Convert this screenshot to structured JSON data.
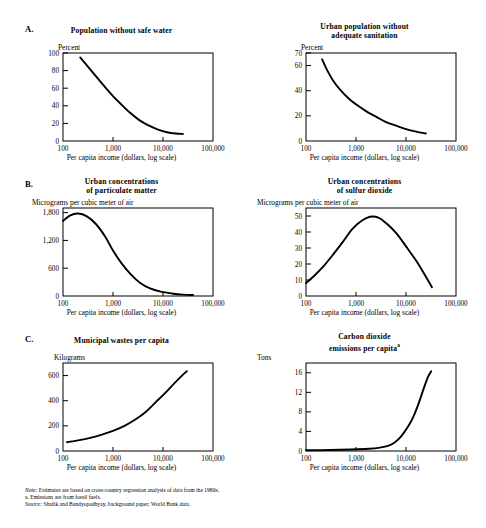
{
  "figure": {
    "panels": [
      {
        "letter": "A.",
        "left": {
          "title_line1": "Population without safe water",
          "title_line2": "",
          "y_unit": "Percent",
          "x_caption": "Per capita income (dollars, log scale)"
        },
        "right": {
          "title_line1": "Urban population without",
          "title_line2": "adequate sanitation",
          "y_unit": "Percent",
          "x_caption": "Per capita income (dollars, log scale)"
        }
      },
      {
        "letter": "B.",
        "left": {
          "title_line1": "Urban concentrations",
          "title_line2": "of particulate matter",
          "y_unit": "Micrograms per cubic meter of air",
          "x_caption": "Per capita income (dollars, log scale)"
        },
        "right": {
          "title_line1": "Urban concentrations",
          "title_line2": "of sulfur dioxide",
          "y_unit": "Micrograms per cubic meter of air",
          "x_caption": "Per capita income (dollars, log scale)"
        }
      },
      {
        "letter": "C.",
        "left": {
          "title_line1": "Municipal wastes per capita",
          "title_line2": "",
          "y_unit": "Kilograms",
          "x_caption": "Per capita income (dollars, log scale)"
        },
        "right": {
          "title_line1": "Carbon dioxide",
          "title_line2": "emissions per capita",
          "title_superscript": "a",
          "y_unit": "Tons",
          "x_caption": "Per capita income (dollars, log scale)"
        }
      }
    ],
    "notes": {
      "note_label": "Note:",
      "note_text": " Estimates are based on cross-country regression analysis of data from the 1980s.",
      "footnote_a": "a. Emissions are from fossil fuels.",
      "source_label": "Source:",
      "source_text": " Shafik and Bandyopadhyay, background paper; World Bank data."
    }
  },
  "chart_data": [
    {
      "id": "population-without-safe-water",
      "type": "line",
      "title": "Population without safe water",
      "xlabel": "Per capita income (dollars, log scale)",
      "ylabel": "Percent",
      "xscale": "log",
      "xlim": [
        100,
        100000
      ],
      "ylim": [
        0,
        100
      ],
      "xticks": [
        100,
        1000,
        10000,
        100000
      ],
      "xticklabels": [
        "100",
        "1,000",
        "10,000",
        "100,000"
      ],
      "yticks": [
        0,
        20,
        40,
        60,
        80,
        100
      ],
      "yticklabels": [
        "0",
        "20",
        "40",
        "60",
        "80",
        "100"
      ],
      "grid": false,
      "legend": "none",
      "x": [
        220,
        300,
        450,
        700,
        1000,
        1500,
        2200,
        3300,
        5000,
        8000,
        12000,
        18000,
        25000
      ],
      "y": [
        95,
        86,
        74,
        61,
        51,
        41,
        32,
        24,
        18,
        13,
        10,
        8.5,
        8
      ]
    },
    {
      "id": "urban-population-without-adequate-sanitation",
      "type": "line",
      "title": "Urban population without adequate sanitation",
      "xlabel": "Per capita income (dollars, log scale)",
      "ylabel": "Percent",
      "xscale": "log",
      "xlim": [
        100,
        100000
      ],
      "ylim": [
        0,
        70
      ],
      "xticks": [
        100,
        1000,
        10000,
        100000
      ],
      "xticklabels": [
        "100",
        "1,000",
        "10,000",
        "100,000"
      ],
      "yticks": [
        0,
        20,
        40,
        60,
        70
      ],
      "yticklabels": [
        "0",
        "20",
        "40",
        "60",
        "70"
      ],
      "grid": false,
      "legend": "none",
      "x": [
        210,
        260,
        350,
        500,
        750,
        1100,
        1700,
        2600,
        4000,
        6500,
        10000,
        16000,
        25000
      ],
      "y": [
        65,
        57,
        48,
        40,
        33,
        28,
        23,
        19,
        15,
        12,
        9.5,
        7.5,
        6
      ]
    },
    {
      "id": "urban-concentrations-of-particulate-matter",
      "type": "line",
      "title": "Urban concentrations of particulate matter",
      "xlabel": "Per capita income (dollars, log scale)",
      "ylabel": "Micrograms per cubic meter of air",
      "xscale": "log",
      "xlim": [
        100,
        100000
      ],
      "ylim": [
        0,
        1900
      ],
      "xticks": [
        100,
        1000,
        10000,
        100000
      ],
      "xticklabels": [
        "100",
        "1,000",
        "10,000",
        "100,000"
      ],
      "yticks": [
        0,
        600,
        1200,
        1800
      ],
      "yticklabels": [
        "0",
        "600",
        "1,200",
        "1,800"
      ],
      "grid": false,
      "legend": "none",
      "x": [
        100,
        140,
        200,
        300,
        450,
        700,
        1000,
        1500,
        2300,
        3500,
        5500,
        9000,
        15000,
        25000,
        40000
      ],
      "y": [
        1620,
        1740,
        1780,
        1720,
        1560,
        1280,
        980,
        700,
        460,
        280,
        165,
        95,
        55,
        30,
        20
      ]
    },
    {
      "id": "urban-concentrations-of-sulfur-dioxide",
      "type": "line",
      "title": "Urban concentrations of sulfur dioxide",
      "xlabel": "Per capita income (dollars, log scale)",
      "ylabel": "Micrograms per cubic meter of air",
      "xscale": "log",
      "xlim": [
        100,
        100000
      ],
      "ylim": [
        0,
        55
      ],
      "xticks": [
        100,
        1000,
        10000,
        100000
      ],
      "xticklabels": [
        "100",
        "1,000",
        "10,000",
        "100,000"
      ],
      "yticks": [
        0,
        10,
        20,
        30,
        40,
        50
      ],
      "yticklabels": [
        "0",
        "10",
        "20",
        "30",
        "40",
        "50"
      ],
      "grid": false,
      "legend": "none",
      "x": [
        100,
        150,
        230,
        350,
        550,
        850,
        1300,
        1900,
        2800,
        4200,
        6500,
        10000,
        16000,
        24000,
        33000
      ],
      "y": [
        8,
        13,
        19,
        26,
        34,
        42,
        47,
        49.5,
        49,
        45,
        39,
        31,
        22,
        13,
        5.5
      ]
    },
    {
      "id": "municipal-wastes-per-capita",
      "type": "line",
      "title": "Municipal wastes per capita",
      "xlabel": "Per capita income (dollars, log scale)",
      "ylabel": "Kilograms",
      "xscale": "log",
      "xlim": [
        100,
        100000
      ],
      "ylim": [
        0,
        700
      ],
      "xticks": [
        100,
        1000,
        10000,
        100000
      ],
      "xticklabels": [
        "100",
        "1,000",
        "10,000",
        "100,000"
      ],
      "yticks": [
        0,
        200,
        400,
        600
      ],
      "yticklabels": [
        "0",
        "200",
        "400",
        "600"
      ],
      "grid": false,
      "legend": "none",
      "x": [
        120,
        200,
        350,
        600,
        1000,
        1700,
        2800,
        4500,
        7000,
        11000,
        17000,
        24000,
        30000
      ],
      "y": [
        70,
        85,
        105,
        130,
        160,
        200,
        250,
        310,
        385,
        460,
        540,
        600,
        635
      ]
    },
    {
      "id": "carbon-dioxide-emissions-per-capita",
      "type": "line",
      "title": "Carbon dioxide emissions per capita",
      "xlabel": "Per capita income (dollars, log scale)",
      "ylabel": "Tons",
      "xscale": "log",
      "xlim": [
        100,
        100000
      ],
      "ylim": [
        0,
        18
      ],
      "xticks": [
        100,
        1000,
        10000,
        100000
      ],
      "xticklabels": [
        "100",
        "1,000",
        "10,000",
        "100,000"
      ],
      "yticks": [
        0,
        4,
        8,
        12,
        16
      ],
      "yticklabels": [
        "0",
        "4",
        "8",
        "12",
        "16"
      ],
      "grid": false,
      "legend": "none",
      "x": [
        100,
        300,
        800,
        1800,
        3000,
        4500,
        6000,
        8000,
        11000,
        14000,
        18000,
        23000,
        28000,
        32000
      ],
      "y": [
        0.15,
        0.2,
        0.3,
        0.45,
        0.7,
        1.1,
        1.8,
        3.0,
        5.0,
        7.0,
        9.8,
        13.0,
        15.3,
        16.3
      ]
    }
  ]
}
